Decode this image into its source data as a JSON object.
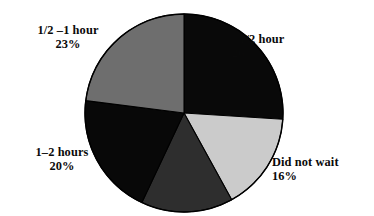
{
  "chart_data": {
    "type": "pie",
    "title": "",
    "subtitle": "",
    "xlabel": "",
    "ylabel": "",
    "legend_position": "none",
    "grid": false,
    "units": "percent",
    "start_angle_deg": 0,
    "direction": "clockwise",
    "categories": [
      "<1/2 hour",
      "Did not wait",
      "",
      "1–2 hours",
      "1/2 –1 hour"
    ],
    "values": [
      26,
      16,
      15,
      20,
      23
    ],
    "slices": [
      {
        "id": "lt-half-hour",
        "label": "<1/2 hour",
        "percent_text": "26%",
        "value": 26,
        "color": "#090909",
        "start_deg": 0,
        "end_deg": 93.6,
        "labeled": true
      },
      {
        "id": "did-not-wait",
        "label": "Did not wait",
        "percent_text": "16%",
        "value": 16,
        "color": "#cbcbcb",
        "start_deg": 93.6,
        "end_deg": 151.2,
        "labeled": true
      },
      {
        "id": "unlabeled-wedge",
        "label": "",
        "percent_text": "",
        "value": 15,
        "color": "#2e2e2e",
        "start_deg": 151.2,
        "end_deg": 205.2,
        "labeled": false
      },
      {
        "id": "one-to-two-hours",
        "label": "1–2 hours",
        "percent_text": "20%",
        "value": 20,
        "color": "#080808",
        "start_deg": 205.2,
        "end_deg": 277.2,
        "labeled": true
      },
      {
        "id": "half-to-one-hour",
        "label": "1/2 –1 hour",
        "percent_text": "23%",
        "value": 23,
        "color": "#6e6e6e",
        "start_deg": 277.2,
        "end_deg": 360,
        "labeled": true
      }
    ]
  },
  "labels": {
    "lt_half_hour": {
      "name": "<1/2 hour",
      "percent": "26%"
    },
    "half_one_hour": {
      "name": "1/2 –1 hour",
      "percent": "23%"
    },
    "one_two_hours": {
      "name": "1–2 hours",
      "percent": "20%"
    },
    "did_not_wait": {
      "name": "Did not wait",
      "percent": "16%"
    }
  },
  "colors": {
    "background": "#ffffff",
    "text": "#0a0a0a",
    "outline": "#000000",
    "slice_black": "#090909",
    "slice_dark_gray": "#2e2e2e",
    "slice_medium_gray": "#6e6e6e",
    "slice_light_gray": "#cbcbcb"
  },
  "geometry": {
    "center_x": 184,
    "center_y": 113,
    "radius": 99
  }
}
